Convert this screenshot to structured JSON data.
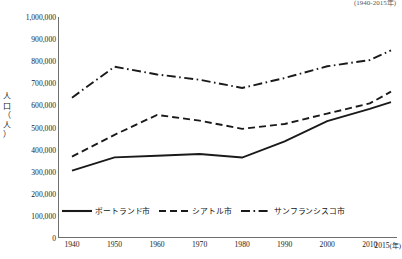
{
  "top_note": "(1940-2015年)",
  "chart_data": {
    "type": "line",
    "title": "",
    "subtitle": "(1940-2015年)",
    "xlabel": "年",
    "ylabel": "人口（人）",
    "x": [
      1940,
      1950,
      1960,
      1970,
      1980,
      1990,
      2000,
      2010,
      2015
    ],
    "categories": [
      "1940",
      "1950",
      "1960",
      "1970",
      "1980",
      "1990",
      "2000",
      "2010",
      "2015"
    ],
    "xtick_labels": [
      "1940",
      "1950",
      "1960",
      "1970",
      "1980",
      "1990",
      "2000",
      "2010",
      "2015"
    ],
    "xtick_unit": "(年)",
    "ytick_labels": [
      "0",
      "100,000",
      "200,000",
      "300,000",
      "400,000",
      "500,000",
      "600,000",
      "700,000",
      "800,000",
      "900,000",
      "1,000,000"
    ],
    "ytick_values": [
      0,
      100000,
      200000,
      300000,
      400000,
      500000,
      600000,
      700000,
      800000,
      900000,
      1000000
    ],
    "ylim": [
      0,
      1000000
    ],
    "xlim": [
      1940,
      2015
    ],
    "grid": false,
    "legend_position": "bottom-left",
    "series": [
      {
        "name": "ポートランド市",
        "style": "solid",
        "color": "#1a1a1a",
        "values": [
          305000,
          365000,
          372000,
          380000,
          364000,
          437000,
          529000,
          584000,
          615000
        ]
      },
      {
        "name": "シアトル市",
        "style": "dashed",
        "color": "#1a1a1a",
        "values": [
          368000,
          467000,
          557000,
          531000,
          494000,
          516000,
          563000,
          609000,
          662000
        ]
      },
      {
        "name": "サンフランシスコ市",
        "style": "dashdot",
        "color": "#1a1a1a",
        "values": [
          635000,
          775000,
          740000,
          716000,
          679000,
          724000,
          777000,
          805000,
          849000
        ]
      }
    ]
  },
  "legend": {
    "items": [
      {
        "label": "ポートランド市",
        "style": "solid"
      },
      {
        "label": "シアトル市",
        "style": "dashed"
      },
      {
        "label": "サンフランシスコ市",
        "style": "dashdot"
      }
    ]
  }
}
